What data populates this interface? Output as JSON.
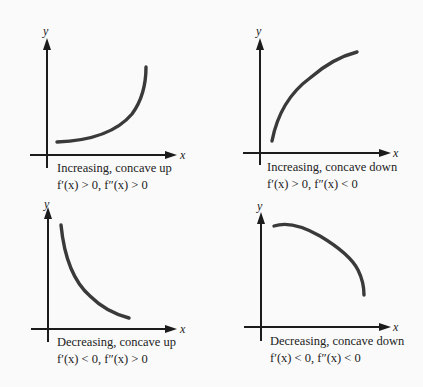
{
  "panels": [
    {
      "id": "increasing-concave-up",
      "x_label": "x",
      "y_label": "y",
      "caption": "Increasing, concave up",
      "condition": "f′(x) > 0, f″(x) > 0"
    },
    {
      "id": "increasing-concave-down",
      "x_label": "x",
      "y_label": "y",
      "caption": "Increasing, concave down",
      "condition": "f′(x) > 0, f″(x) < 0"
    },
    {
      "id": "decreasing-concave-up",
      "x_label": "x",
      "y_label": "y",
      "caption": "Decreasing, concave up",
      "condition": "f′(x) < 0, f″(x) > 0"
    },
    {
      "id": "decreasing-concave-down",
      "x_label": "x",
      "y_label": "y",
      "caption": "Decreasing, concave down",
      "condition": "f′(x) < 0, f″(x) < 0"
    }
  ],
  "colors": {
    "background": "#fafafa",
    "axis": "#1c1c1c",
    "curve": "#3a3a3a",
    "text": "#222222"
  }
}
